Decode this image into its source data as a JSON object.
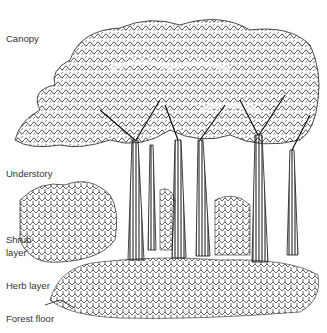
{
  "diagram": {
    "layers": [
      {
        "label": "Canopy"
      },
      {
        "label": "Understory"
      },
      {
        "label": "Shrub\nlayer"
      },
      {
        "label": "Herb layer"
      },
      {
        "label": "Forest floor"
      }
    ]
  }
}
